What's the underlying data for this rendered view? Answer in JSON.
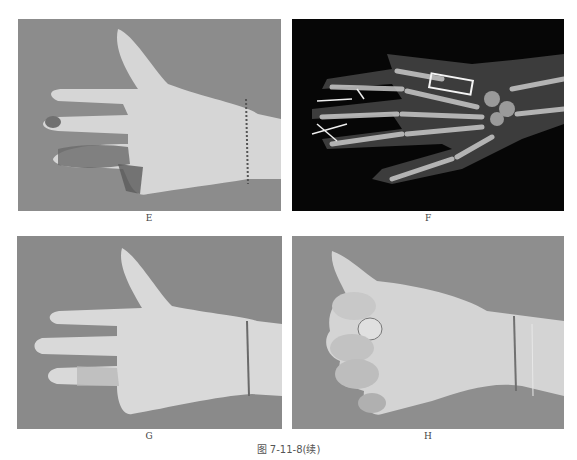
{
  "figure": {
    "caption": "图 7-11-8(续)",
    "panels": [
      {
        "id": "E",
        "label": "E",
        "kind": "clinical-photo",
        "description": "palmar hand, post-operative wounds on ring & little fingers"
      },
      {
        "id": "F",
        "label": "F",
        "kind": "x-ray",
        "description": "hand radiograph with metacarpal plate and K-wires"
      },
      {
        "id": "G",
        "label": "G",
        "kind": "clinical-photo",
        "description": "palmar hand, healed fingers extended"
      },
      {
        "id": "H",
        "label": "H",
        "kind": "clinical-photo",
        "description": "hand making a fist, flexion function"
      }
    ]
  },
  "colors": {
    "background": "#ffffff",
    "photo_bg": "#8a8a8a",
    "skin": "#d9d9d9",
    "xray_bg": "#050505",
    "bone": "#bdbdbd"
  }
}
